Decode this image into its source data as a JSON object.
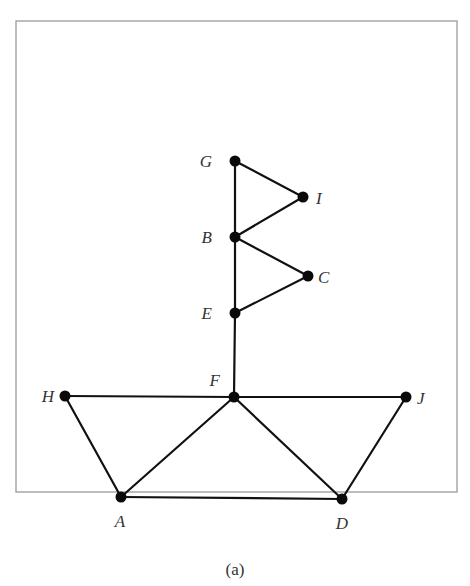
{
  "figure": {
    "caption": "(a)",
    "frame": {
      "x": 16,
      "y": 21,
      "width": 441,
      "height": 471
    }
  },
  "graph": {
    "nodes": [
      {
        "id": "G",
        "label": "G",
        "x": 235,
        "y": 161,
        "label_x": 212,
        "label_y": 167,
        "anchor": "end"
      },
      {
        "id": "I",
        "label": "I",
        "x": 303,
        "y": 197,
        "label_x": 316,
        "label_y": 204,
        "anchor": "start"
      },
      {
        "id": "B",
        "label": "B",
        "x": 235,
        "y": 237,
        "label_x": 212,
        "label_y": 243,
        "anchor": "end"
      },
      {
        "id": "C",
        "label": "C",
        "x": 308,
        "y": 276,
        "label_x": 318,
        "label_y": 283,
        "anchor": "start"
      },
      {
        "id": "E",
        "label": "E",
        "x": 235,
        "y": 313,
        "label_x": 212,
        "label_y": 319,
        "anchor": "end"
      },
      {
        "id": "F",
        "label": "F",
        "x": 234,
        "y": 397,
        "label_x": 220,
        "label_y": 386,
        "anchor": "end"
      },
      {
        "id": "H",
        "label": "H",
        "x": 65,
        "y": 396,
        "label_x": 54,
        "label_y": 402,
        "anchor": "end"
      },
      {
        "id": "J",
        "label": "J",
        "x": 406,
        "y": 397,
        "label_x": 417,
        "label_y": 404,
        "anchor": "start"
      },
      {
        "id": "A",
        "label": "A",
        "x": 121,
        "y": 497,
        "label_x": 120,
        "label_y": 527,
        "anchor": "middle"
      },
      {
        "id": "D",
        "label": "D",
        "x": 342,
        "y": 499,
        "label_x": 342,
        "label_y": 529,
        "anchor": "middle"
      }
    ],
    "edges": [
      [
        "G",
        "I"
      ],
      [
        "G",
        "B"
      ],
      [
        "I",
        "B"
      ],
      [
        "B",
        "C"
      ],
      [
        "B",
        "E"
      ],
      [
        "C",
        "E"
      ],
      [
        "E",
        "F"
      ],
      [
        "H",
        "F"
      ],
      [
        "F",
        "J"
      ],
      [
        "H",
        "A"
      ],
      [
        "A",
        "F"
      ],
      [
        "F",
        "D"
      ],
      [
        "J",
        "D"
      ],
      [
        "A",
        "D"
      ]
    ]
  }
}
